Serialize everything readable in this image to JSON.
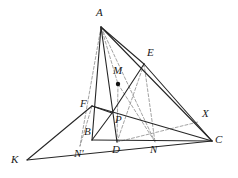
{
  "figure": {
    "kind": "euclidean-geometry-diagram",
    "width": 238,
    "height": 178,
    "background_color": "#ffffff",
    "stroke_color": "#262626",
    "dashed_stroke_color": "#8c8c8c",
    "marked_point_color": "#111111",
    "solid_stroke_width": 1.1,
    "dashed_stroke_width": 0.8,
    "dash_pattern": "3,2"
  },
  "points": [
    {
      "id": "A",
      "label": "A",
      "x": 101,
      "y": 27,
      "label_x": 96,
      "label_y": 7,
      "marked": false
    },
    {
      "id": "E",
      "label": "E",
      "x": 144,
      "y": 64,
      "label_x": 147,
      "label_y": 47,
      "marked": false
    },
    {
      "id": "M",
      "label": "M",
      "x": 118,
      "y": 84,
      "label_x": 113,
      "label_y": 65,
      "marked": true
    },
    {
      "id": "F",
      "label": "F",
      "x": 92,
      "y": 106,
      "label_x": 80,
      "label_y": 98,
      "marked": false
    },
    {
      "id": "X",
      "label": "X",
      "x": 198,
      "y": 122,
      "label_x": 202,
      "label_y": 108,
      "marked": false
    },
    {
      "id": "P",
      "label": "P",
      "x": 112,
      "y": 113,
      "label_x": 115,
      "label_y": 114,
      "marked": false
    },
    {
      "id": "B",
      "label": "B",
      "x": 92,
      "y": 140,
      "label_x": 84,
      "label_y": 126,
      "marked": false
    },
    {
      "id": "D",
      "label": "D",
      "x": 117,
      "y": 142,
      "label_x": 112,
      "label_y": 144,
      "marked": false
    },
    {
      "id": "N",
      "label": "N",
      "x": 155,
      "y": 142,
      "label_x": 150,
      "label_y": 144,
      "marked": false
    },
    {
      "id": "C",
      "label": "C",
      "x": 212,
      "y": 141,
      "label_x": 215,
      "label_y": 134,
      "marked": false
    },
    {
      "id": "Np",
      "label": "N'",
      "x": 80,
      "y": 146,
      "label_x": 74,
      "label_y": 148,
      "marked": false
    },
    {
      "id": "K",
      "label": "K",
      "x": 27,
      "y": 160,
      "label_x": 11,
      "label_y": 154,
      "marked": false
    }
  ],
  "solid_segments": [
    {
      "name": "A-B",
      "from": "A",
      "to": "B"
    },
    {
      "name": "A-D",
      "from": "A",
      "to": "D"
    },
    {
      "name": "A-C",
      "from": "A",
      "to": "C"
    },
    {
      "name": "A-E",
      "from": "A",
      "to": "E"
    },
    {
      "name": "B-C",
      "from": "B",
      "to": "C"
    },
    {
      "name": "E-C",
      "from": "E",
      "to": "C"
    },
    {
      "name": "E-P",
      "from": "E",
      "to": "P"
    },
    {
      "name": "F-C",
      "from": "F",
      "to": "C"
    },
    {
      "name": "K-F",
      "from": "K",
      "to": "F"
    },
    {
      "name": "K-C",
      "from": "K",
      "to": "C"
    },
    {
      "name": "F-P",
      "from": "F",
      "to": "P"
    },
    {
      "name": "B-P",
      "from": "B",
      "to": "P"
    }
  ],
  "dashed_segments": [
    {
      "name": "A-Np",
      "from": "A",
      "to": "Np"
    },
    {
      "name": "A-N",
      "from": "A",
      "to": "N"
    },
    {
      "name": "A-M",
      "from": "A",
      "to": "M"
    },
    {
      "name": "M-D",
      "from": "M",
      "to": "D"
    },
    {
      "name": "M-N",
      "from": "M",
      "to": "N"
    },
    {
      "name": "E-D",
      "from": "E",
      "to": "D"
    },
    {
      "name": "E-N",
      "from": "E",
      "to": "N"
    },
    {
      "name": "D-X",
      "from": "D",
      "to": "X"
    },
    {
      "name": "F-Np",
      "from": "F",
      "to": "Np"
    }
  ]
}
